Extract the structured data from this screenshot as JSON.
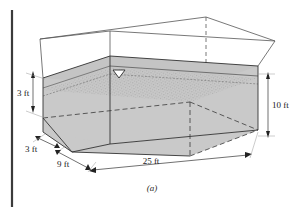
{
  "figure": {
    "caption": "(a)",
    "page_edge_visible": true,
    "colors": {
      "soil_fill": "#c9c9c9",
      "soil_fill_top": "#c4c4c4",
      "outline": "#333333",
      "hidden_line": "#3a3a3a",
      "page_edge": "#3b3b3b",
      "background": "#ffffff",
      "text": "#1a1a1a"
    },
    "symbols": {
      "water_table": "▽",
      "water_table_name": "water-table-triangle"
    },
    "dimensions": [
      {
        "id": "depth-to-water",
        "label": "3 ft",
        "value": 3,
        "unit": "ft",
        "position": "left-upper",
        "orientation": "vertical"
      },
      {
        "id": "berm-height",
        "label": "3 ft",
        "value": 3,
        "unit": "ft",
        "position": "left-lower",
        "orientation": "diagonal"
      },
      {
        "id": "width",
        "label": "9 ft",
        "value": 9,
        "unit": "ft",
        "position": "bottom-left",
        "orientation": "diagonal"
      },
      {
        "id": "length",
        "label": "25 ft",
        "value": 25,
        "unit": "ft",
        "position": "bottom-front",
        "orientation": "horizontal"
      },
      {
        "id": "depth",
        "label": "10 ft",
        "value": 10,
        "unit": "ft",
        "position": "right",
        "orientation": "vertical"
      }
    ]
  }
}
